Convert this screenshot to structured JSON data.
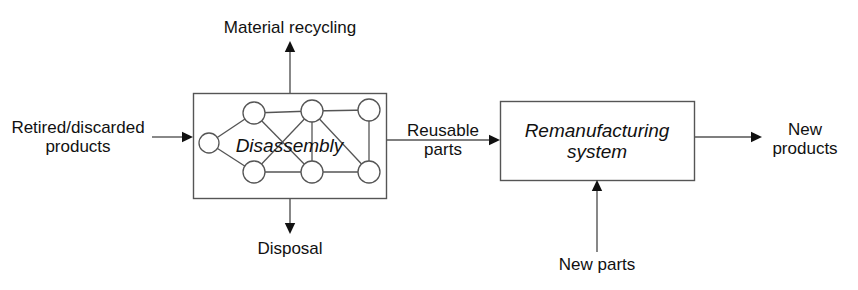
{
  "diagram": {
    "type": "block-flow-diagram",
    "stroke_color": "#555555",
    "text_color": "#111111",
    "background": "#ffffff",
    "boxes": [
      {
        "id": "disassembly",
        "label": "Disassembly",
        "style": "italic",
        "x": 193,
        "y": 93,
        "w": 193,
        "h": 105
      },
      {
        "id": "remanufacturing",
        "label": "Remanufacturing\nsystem",
        "style": "italic",
        "x": 500,
        "y": 101,
        "w": 194,
        "h": 79
      }
    ],
    "graph_nodes": [
      {
        "id": "n0",
        "cx": 209,
        "cy": 143,
        "r": 10
      },
      {
        "id": "n1",
        "cx": 254,
        "cy": 113,
        "r": 11
      },
      {
        "id": "n2",
        "cx": 312,
        "cy": 111,
        "r": 11
      },
      {
        "id": "n3",
        "cx": 369,
        "cy": 110,
        "r": 11
      },
      {
        "id": "n4",
        "cx": 254,
        "cy": 172,
        "r": 11
      },
      {
        "id": "n5",
        "cx": 312,
        "cy": 172,
        "r": 11
      },
      {
        "id": "n6",
        "cx": 369,
        "cy": 172,
        "r": 11
      }
    ],
    "graph_edges": [
      [
        "n0",
        "n1"
      ],
      [
        "n0",
        "n4"
      ],
      [
        "n1",
        "n2"
      ],
      [
        "n1",
        "n5"
      ],
      [
        "n2",
        "n3"
      ],
      [
        "n2",
        "n4"
      ],
      [
        "n2",
        "n5"
      ],
      [
        "n2",
        "n6"
      ],
      [
        "n3",
        "n6"
      ],
      [
        "n4",
        "n5"
      ],
      [
        "n5",
        "n6"
      ]
    ],
    "labels": [
      {
        "id": "material-recycling",
        "text": "Material recycling",
        "x": 290,
        "y": 28
      },
      {
        "id": "retired-discarded-products",
        "text": "Retired/discarded\nproducts",
        "x": 78,
        "y": 137
      },
      {
        "id": "reusable-parts",
        "text": "Reusable\nparts",
        "x": 443,
        "y": 140
      },
      {
        "id": "new-products",
        "text": "New\nproducts",
        "x": 805,
        "y": 139
      },
      {
        "id": "new-parts",
        "text": "New parts",
        "x": 597,
        "y": 265
      },
      {
        "id": "disposal",
        "text": "Disposal",
        "x": 290,
        "y": 249
      }
    ],
    "arrows": [
      {
        "id": "input-arrow",
        "from_label": "Retired/discarded products",
        "to_box": "disassembly",
        "x1": 152,
        "y1": 137,
        "x2": 193,
        "y2": 137,
        "direction": "right"
      },
      {
        "id": "material-recycling-arrow",
        "from_box": "disassembly",
        "to_label": "Material recycling",
        "x1": 290,
        "y1": 93,
        "x2": 290,
        "y2": 41,
        "direction": "up"
      },
      {
        "id": "disposal-arrow",
        "from_box": "disassembly",
        "to_label": "Disposal",
        "x1": 290,
        "y1": 198,
        "x2": 290,
        "y2": 234,
        "direction": "down"
      },
      {
        "id": "reusable-parts-arrow",
        "from_box": "disassembly",
        "to_box": "remanufacturing",
        "x1": 386,
        "y1": 140,
        "x2": 500,
        "y2": 140,
        "direction": "right"
      },
      {
        "id": "new-parts-arrow",
        "from_label": "New parts",
        "to_box": "remanufacturing",
        "x1": 597,
        "y1": 252,
        "x2": 597,
        "y2": 180,
        "direction": "up"
      },
      {
        "id": "new-products-arrow",
        "from_box": "remanufacturing",
        "to_label": "New products",
        "x1": 694,
        "y1": 137,
        "x2": 762,
        "y2": 137,
        "direction": "right"
      }
    ]
  }
}
